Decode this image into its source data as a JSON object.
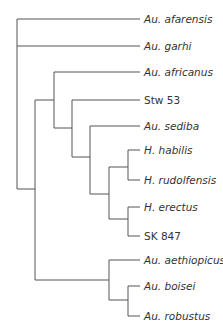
{
  "diagram": {
    "type": "cladogram",
    "line_color": "#555555",
    "taxa": [
      {
        "label": "Au. afarensis",
        "italic": true,
        "y": 19
      },
      {
        "label": "Au. garhi",
        "italic": true,
        "y": 46
      },
      {
        "label": "Au. africanus",
        "italic": true,
        "y": 72
      },
      {
        "label": "Stw 53",
        "italic": false,
        "y": 100
      },
      {
        "label": "Au. sediba",
        "italic": true,
        "y": 126
      },
      {
        "label": "H. habilis",
        "italic": true,
        "y": 150
      },
      {
        "label": "H. rudolfensis",
        "italic": true,
        "y": 180
      },
      {
        "label": "H. erectus",
        "italic": true,
        "y": 207
      },
      {
        "label": "SK 847",
        "italic": false,
        "y": 236
      },
      {
        "label": "Au. aethiopicus",
        "italic": true,
        "y": 260
      },
      {
        "label": "Au. boisei",
        "italic": true,
        "y": 286
      },
      {
        "label": "Au. robustus",
        "italic": true,
        "y": 316
      }
    ]
  }
}
